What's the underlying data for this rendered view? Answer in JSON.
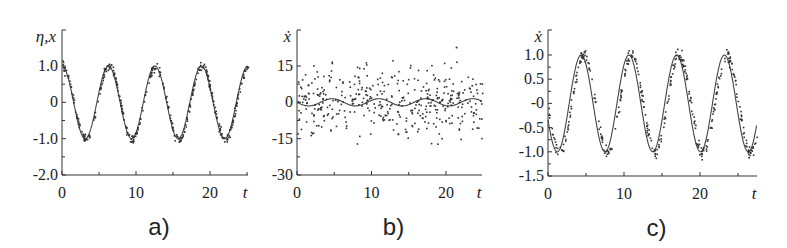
{
  "chart_data": [
    {
      "type": "line",
      "panel_label": "a)",
      "ylabel": "η,x",
      "xlabel": "t",
      "xlim": [
        0,
        25
      ],
      "ylim": [
        -2.0,
        1.5
      ],
      "x_ticks": [
        0,
        10,
        20
      ],
      "x_tick_labels": [
        "0",
        "10",
        "20"
      ],
      "y_ticks": [
        1.0,
        0,
        -1.0,
        -2.0
      ],
      "y_tick_labels": [
        "1.0",
        "0",
        "-1.0",
        "-2.0"
      ],
      "grid": false,
      "series": [
        {
          "name": "x (solid line)",
          "style": "line",
          "function": "cos(t)",
          "amplitude": 1.0,
          "period": 6.3,
          "phase": 0
        },
        {
          "name": "η (noisy points)",
          "style": "scatter",
          "noise_std": 0.06,
          "follows": "cos(t)"
        }
      ],
      "px": {
        "x0": 62,
        "x1": 248,
        "y_top": 30,
        "y_axis": 175,
        "ymap": [
          [
            1.0,
            66
          ],
          [
            -2.0,
            175
          ]
        ],
        "xmap": [
          [
            0,
            62
          ],
          [
            20,
            210
          ]
        ]
      }
    },
    {
      "type": "scatter",
      "panel_label": "b)",
      "ylabel": "ẋ",
      "xlabel": "t",
      "xlim": [
        0,
        25
      ],
      "ylim": [
        -30,
        25
      ],
      "x_ticks": [
        0,
        10,
        20
      ],
      "x_tick_labels": [
        "0",
        "10",
        "20"
      ],
      "y_ticks": [
        15,
        0,
        -15,
        -30
      ],
      "y_tick_labels": [
        "15",
        "0",
        "-15",
        "-30"
      ],
      "grid": false,
      "series": [
        {
          "name": "ẋ (solid line)",
          "style": "line",
          "function": "-sin(t)",
          "amplitude": 1.0,
          "period": 6.3
        },
        {
          "name": "noisy derivative (points)",
          "style": "scatter",
          "noise_std": 7.0,
          "range": [
            -17,
            23
          ]
        }
      ],
      "px": {
        "x0": 297,
        "x1": 482,
        "y_top": 30,
        "y_axis": 175,
        "ymap": [
          [
            15,
            66
          ],
          [
            -30,
            175
          ]
        ],
        "xmap": [
          [
            0,
            297
          ],
          [
            20,
            446
          ]
        ]
      }
    },
    {
      "type": "line",
      "panel_label": "c)",
      "ylabel": "ẋ",
      "xlabel": "t",
      "xlim": [
        0,
        25
      ],
      "ylim": [
        -1.5,
        1.2
      ],
      "x_ticks": [
        0,
        10,
        20
      ],
      "x_tick_labels": [
        "0",
        "10",
        "20"
      ],
      "y_ticks": [
        1.0,
        0.5,
        0,
        -0.5,
        -1.0,
        -1.5
      ],
      "y_tick_labels": [
        "1.0",
        "0.5",
        "-0",
        "-0.5",
        "-1.0",
        "-1.5"
      ],
      "grid": false,
      "series": [
        {
          "name": "ẋ exact (solid line)",
          "style": "line",
          "function": "-sin(t)",
          "amplitude": 1.0,
          "period": 6.3
        },
        {
          "name": "ẋ estimated (points)",
          "style": "scatter",
          "noise_std": 0.07,
          "follows": "-sin(t - 0.25)"
        }
      ],
      "px": {
        "x0": 548,
        "x1": 757,
        "y_top": 30,
        "y_axis": 176,
        "ymap": [
          [
            1.0,
            55
          ],
          [
            -1.5,
            176
          ]
        ],
        "xmap": [
          [
            0,
            548
          ],
          [
            20,
            700
          ]
        ]
      }
    }
  ]
}
